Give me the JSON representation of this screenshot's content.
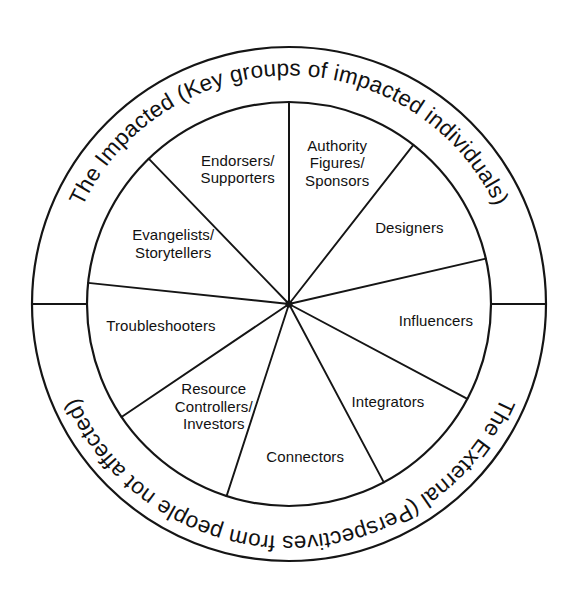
{
  "diagram": {
    "type": "radial-wheel",
    "center": {
      "x": 289,
      "y": 304
    },
    "radii": {
      "outer_ring": 257,
      "inner_ring": 202,
      "wedge": 202
    },
    "rings": {
      "top": {
        "id": "the-impacted",
        "label": "The Impacted (Key groups of impacted individuals)",
        "orientation": "clockwise-upright",
        "span": "left-to-right over top half"
      },
      "bottom": {
        "id": "the-external",
        "label": "The External (Perspectives from people not affected)",
        "orientation": "clockwise-inverted",
        "span": "right-to-left under bottom half"
      }
    },
    "sector_count": 10,
    "sectors": [
      {
        "id": "authority-figures-sponsors",
        "lines": [
          "Authority",
          "Figures/",
          "Sponsors"
        ],
        "start_angle": -90,
        "end_angle": -52,
        "label_angle": -71,
        "label_radius": 148
      },
      {
        "id": "designers",
        "lines": [
          "Designers"
        ],
        "start_angle": -52,
        "end_angle": -13,
        "label_angle": -32,
        "label_radius": 142
      },
      {
        "id": "influencers",
        "lines": [
          "Influencers"
        ],
        "start_angle": -13,
        "end_angle": 28,
        "label_angle": 7,
        "label_radius": 148
      },
      {
        "id": "integrators",
        "lines": [
          "Integrators"
        ],
        "start_angle": 28,
        "end_angle": 62,
        "label_angle": 45,
        "label_radius": 140
      },
      {
        "id": "connectors",
        "lines": [
          "Connectors"
        ],
        "start_angle": 62,
        "end_angle": 108,
        "label_angle": 84,
        "label_radius": 155
      },
      {
        "id": "resource-controllers-investors",
        "lines": [
          "Resource",
          "Controllers/",
          "Investors"
        ],
        "start_angle": 108,
        "end_angle": 146,
        "label_angle": 126,
        "label_radius": 128
      },
      {
        "id": "troubleshooters",
        "lines": [
          "Troubleshooters"
        ],
        "start_angle": 146,
        "end_angle": 186,
        "label_angle": 170,
        "label_radius": 130
      },
      {
        "id": "evangelists-storytellers",
        "lines": [
          "Evangelists/",
          "Storytellers"
        ],
        "start_angle": 186,
        "end_angle": 226,
        "label_angle": 207,
        "label_radius": 130
      },
      {
        "id": "endorsers-supporters",
        "lines": [
          "Endorsers/",
          "Supporters"
        ],
        "start_angle": 226,
        "end_angle": 270,
        "label_angle": 249,
        "label_radius": 143
      }
    ],
    "colors": {
      "stroke": "#151515",
      "background": "#ffffff",
      "text": "#111111"
    }
  }
}
